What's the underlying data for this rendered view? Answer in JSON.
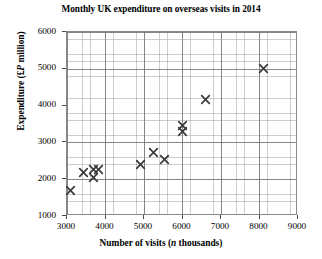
{
  "chart_data": {
    "type": "scatter",
    "title": "Monthly UK expenditure on overseas visits in 2014",
    "xlabel": "Number of visits (n thousands)",
    "xlabel_parts": {
      "prefix": "Number of visits (",
      "italic": "n",
      "suffix": " thousands)"
    },
    "ylabel": "Expenditure (£P million)",
    "ylabel_parts": {
      "prefix": "Expenditure (£",
      "italic": "P",
      "suffix": " million)"
    },
    "xlim": [
      3000,
      9000
    ],
    "ylim": [
      1000,
      6000
    ],
    "xticks": [
      3000,
      4000,
      5000,
      6000,
      7000,
      8000,
      9000
    ],
    "yticks": [
      1000,
      2000,
      3000,
      4000,
      5000,
      6000
    ],
    "x_major_step": 1000,
    "y_major_step": 1000,
    "x_minor_step": 200,
    "y_minor_step": 200,
    "grid": true,
    "grid_minor": true,
    "legend": null,
    "marker": "x-cross",
    "marker_color": "#3a3a3a",
    "points": [
      {
        "x": 3100,
        "y": 1700
      },
      {
        "x": 3440,
        "y": 2180
      },
      {
        "x": 3680,
        "y": 2260
      },
      {
        "x": 3810,
        "y": 2260
      },
      {
        "x": 3700,
        "y": 2050
      },
      {
        "x": 4900,
        "y": 2400
      },
      {
        "x": 5240,
        "y": 2730
      },
      {
        "x": 5520,
        "y": 2540
      },
      {
        "x": 5990,
        "y": 3460
      },
      {
        "x": 5990,
        "y": 3300
      },
      {
        "x": 6600,
        "y": 4160
      },
      {
        "x": 8100,
        "y": 5010
      }
    ]
  },
  "axes": {
    "y_tick_labels": [
      "6000",
      "5000",
      "4000",
      "3000",
      "2000",
      "1000"
    ],
    "x_tick_labels": [
      "3000",
      "4000",
      "5000",
      "6000",
      "7000",
      "8000",
      "9000"
    ]
  },
  "colors": {
    "marker": "#3a3a3a",
    "grid_major": "#787878",
    "grid_minor": "#a5a5a5",
    "axis": "#8a8a8a",
    "text": "#000000",
    "background": "#ffffff"
  }
}
